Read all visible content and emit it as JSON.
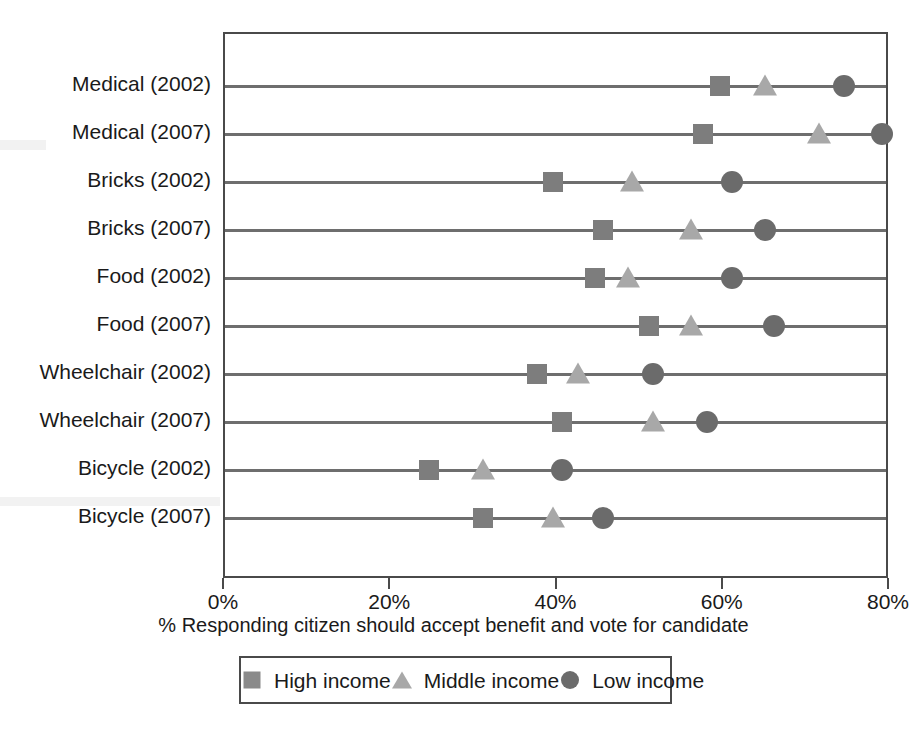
{
  "chart_data": {
    "type": "scatter",
    "title": "",
    "subtitle": "",
    "xlabel": "% Responding citizen should accept benefit and vote for candidate",
    "ylabel": "",
    "xlim": [
      0,
      80
    ],
    "xticks": [
      0,
      20,
      40,
      60,
      80
    ],
    "xtick_labels": [
      "0%",
      "20%",
      "40%",
      "60%",
      "80%"
    ],
    "grid": false,
    "legend_position": "bottom",
    "orientation": "horizontal",
    "categories": [
      "Medical (2002)",
      "Medical (2007)",
      "Bricks (2002)",
      "Bricks (2007)",
      "Food (2002)",
      "Food (2007)",
      "Wheelchair (2002)",
      "Wheelchair (2007)",
      "Bicycle (2002)",
      "Bicycle (2007)"
    ],
    "series": [
      {
        "name": "High income",
        "marker": "square",
        "color": "#7d7d7d",
        "values": [
          59.5,
          57.5,
          39.5,
          45.5,
          44.5,
          51,
          37.5,
          40.5,
          24.5,
          31
        ]
      },
      {
        "name": "Middle income",
        "marker": "triangle",
        "color": "#a8a8a8",
        "values": [
          65,
          71.5,
          49,
          56,
          48.5,
          56,
          42.5,
          51.5,
          31,
          39.5
        ]
      },
      {
        "name": "Low income",
        "marker": "circle",
        "color": "#6b6b6b",
        "values": [
          74.5,
          79,
          61,
          65,
          61,
          66,
          51.5,
          58,
          40.5,
          45.5
        ]
      }
    ]
  },
  "legend": {
    "items": [
      {
        "label": "High income",
        "marker": "square"
      },
      {
        "label": "Middle income",
        "marker": "triangle"
      },
      {
        "label": "Low income",
        "marker": "circle"
      }
    ]
  }
}
